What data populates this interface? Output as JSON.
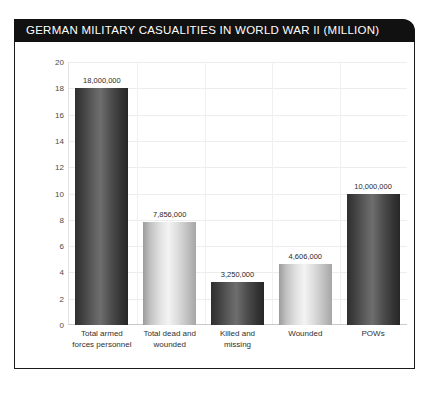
{
  "card": {
    "title": "GERMAN MILITARY CASUALITIES IN WORLD WAR II (MILLION)"
  },
  "chart_data": {
    "type": "bar",
    "title": "GERMAN MILITARY CASUALITIES IN WORLD WAR II (MILLION)",
    "xlabel": "",
    "ylabel": "",
    "ylim": [
      0,
      20
    ],
    "yticks": [
      20,
      18,
      16,
      14,
      12,
      10,
      8,
      6,
      4,
      2,
      0
    ],
    "grid": true,
    "legend": "none",
    "categories": [
      "Total armed forces personnel",
      "Total dead and wounded",
      "Killed and missing",
      "Wounded",
      "POWs"
    ],
    "category_lines": [
      [
        "Total armed",
        "forces personnel"
      ],
      [
        "Total dead and",
        "wounded"
      ],
      [
        "Killed and",
        "missing"
      ],
      [
        "Wounded"
      ],
      [
        "POWs"
      ]
    ],
    "values": [
      18,
      7.856,
      3.25,
      4.606,
      10
    ],
    "data_labels": [
      "18,000,000",
      "7,856,000",
      "3,250,000",
      "4,606,000",
      "10,000,000"
    ],
    "bar_styles": [
      "dark",
      "light",
      "dark",
      "light",
      "dark"
    ],
    "colors": {
      "bar_dark_mid": "#6e6e6e",
      "bar_dark_edge": "#2b2b2b",
      "bar_light_mid": "#f3f3f3",
      "bar_light_edge": "#a2a2a2",
      "title_bar": "#111111",
      "title_text": "#ffffff",
      "frame_border": "#1b1b1b",
      "gridline": "#ededed",
      "background": "#ffffff"
    }
  }
}
